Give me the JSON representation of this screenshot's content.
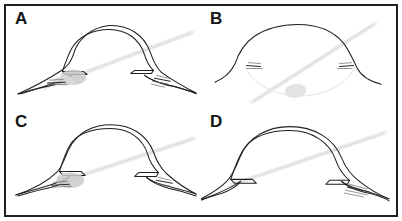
{
  "figure": {
    "border_color": "#231f20",
    "background_color": "#ffffff",
    "layout": "2x2 panel grid",
    "beam_color": "#e3e3e3",
    "ink_color": "#231f20",
    "lens_shade_color": "#c9c9c9"
  },
  "panels": [
    {
      "label": "A",
      "name": "panel-a",
      "description": "Open angle with double-walled cornea, peripheral iris and shaded lens at left angle",
      "has_lens_shading": true,
      "has_slit_beam": true,
      "cornea_style": "double-line arch"
    },
    {
      "label": "B",
      "name": "panel-b",
      "description": "Single-line dome with deep anterior chamber and pale lens low in chamber",
      "has_lens_shading": true,
      "has_slit_beam": true,
      "cornea_style": "single-line dome"
    },
    {
      "label": "C",
      "name": "panel-c",
      "description": "Double-walled cornea with lens tucked into narrow left angle",
      "has_lens_shading": true,
      "has_slit_beam": true,
      "cornea_style": "double-line arch"
    },
    {
      "label": "D",
      "name": "panel-d",
      "description": "Double-walled cornea with closed angle, hatching at right angle, no lens shading",
      "has_lens_shading": false,
      "has_slit_beam": true,
      "cornea_style": "double-line arch"
    }
  ]
}
